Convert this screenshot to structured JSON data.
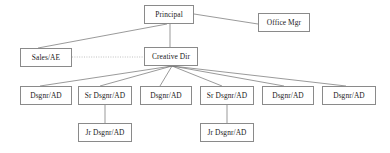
{
  "chart_title": "Agency Organizational Chart",
  "canvas": {
    "width": 390,
    "height": 153,
    "background": "#ffffff"
  },
  "style": {
    "box_border_color": "#8a8a8a",
    "box_fill": "#ffffff",
    "solid_edge_color": "#6e6e6e",
    "dotted_edge_color": "#b0b0b0",
    "text_color": "#1a1a1a"
  },
  "nodes": [
    {
      "id": "principal",
      "label": "Principal",
      "x": 144,
      "y": 5,
      "w": 50,
      "h": 19,
      "level": 0
    },
    {
      "id": "office_mgr",
      "label": "Office Mgr",
      "x": 258,
      "y": 13,
      "w": 52,
      "h": 19,
      "level": 1
    },
    {
      "id": "sales_ae",
      "label": "Sales/AE",
      "x": 20,
      "y": 48,
      "w": 52,
      "h": 19,
      "level": 1
    },
    {
      "id": "creative_dir",
      "label": "Creative Dir",
      "x": 144,
      "y": 47,
      "w": 54,
      "h": 19,
      "level": 1
    },
    {
      "id": "dsgnr_1",
      "label": "Dsgnr/AD",
      "x": 20,
      "y": 86,
      "w": 52,
      "h": 19,
      "level": 2
    },
    {
      "id": "sr_dsgnr_1",
      "label": "Sr Dsgnr/AD",
      "x": 78,
      "y": 86,
      "w": 54,
      "h": 19,
      "level": 2
    },
    {
      "id": "dsgnr_2",
      "label": "Dsgnr/AD",
      "x": 140,
      "y": 86,
      "w": 52,
      "h": 19,
      "level": 2
    },
    {
      "id": "sr_dsgnr_2",
      "label": "Sr Dsgnr/AD",
      "x": 200,
      "y": 86,
      "w": 54,
      "h": 19,
      "level": 2
    },
    {
      "id": "dsgnr_3",
      "label": "Dsgnr/AD",
      "x": 262,
      "y": 86,
      "w": 52,
      "h": 19,
      "level": 2
    },
    {
      "id": "dsgnr_4",
      "label": "Dsgnr/AD",
      "x": 322,
      "y": 86,
      "w": 54,
      "h": 19,
      "level": 2
    },
    {
      "id": "jr_dsgnr_1",
      "label": "Jr Dsgnr/AD",
      "x": 78,
      "y": 123,
      "w": 54,
      "h": 19,
      "level": 3
    },
    {
      "id": "jr_dsgnr_2",
      "label": "Jr Dsgnr/AD",
      "x": 200,
      "y": 123,
      "w": 54,
      "h": 19,
      "level": 3
    }
  ],
  "edges": [
    {
      "from": "principal",
      "to": "office_mgr",
      "style": "solid",
      "x1": 194,
      "y1": 14,
      "x2": 258,
      "y2": 24
    },
    {
      "from": "principal",
      "to": "sales_ae",
      "style": "solid",
      "x1": 167,
      "y1": 24,
      "x2": 38,
      "y2": 48
    },
    {
      "from": "principal",
      "to": "creative_dir",
      "style": "solid",
      "x1": 170,
      "y1": 24,
      "x2": 170,
      "y2": 47
    },
    {
      "from": "sales_ae",
      "to": "creative_dir",
      "style": "dotted",
      "x1": 72,
      "y1": 57,
      "x2": 144,
      "y2": 57
    },
    {
      "from": "creative_dir",
      "to": "dsgnr_1",
      "style": "solid",
      "x1": 172,
      "y1": 66,
      "x2": 40,
      "y2": 86
    },
    {
      "from": "creative_dir",
      "to": "sr_dsgnr_1",
      "style": "solid",
      "x1": 172,
      "y1": 66,
      "x2": 100,
      "y2": 86
    },
    {
      "from": "creative_dir",
      "to": "dsgnr_2",
      "style": "solid",
      "x1": 172,
      "y1": 66,
      "x2": 160,
      "y2": 86
    },
    {
      "from": "creative_dir",
      "to": "sr_dsgnr_2",
      "style": "solid",
      "x1": 172,
      "y1": 66,
      "x2": 222,
      "y2": 86
    },
    {
      "from": "creative_dir",
      "to": "dsgnr_3",
      "style": "solid",
      "x1": 172,
      "y1": 66,
      "x2": 284,
      "y2": 86
    },
    {
      "from": "creative_dir",
      "to": "dsgnr_4",
      "style": "solid",
      "x1": 172,
      "y1": 66,
      "x2": 346,
      "y2": 86
    },
    {
      "from": "sr_dsgnr_1",
      "to": "jr_dsgnr_1",
      "style": "solid",
      "x1": 105,
      "y1": 105,
      "x2": 105,
      "y2": 123
    },
    {
      "from": "sr_dsgnr_2",
      "to": "jr_dsgnr_2",
      "style": "solid",
      "x1": 227,
      "y1": 105,
      "x2": 227,
      "y2": 123
    }
  ]
}
